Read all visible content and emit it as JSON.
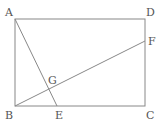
{
  "diagram": {
    "type": "geometry",
    "points": {
      "A": {
        "label": "A",
        "x": 15,
        "y": 19,
        "lx": 5,
        "ly": 16
      },
      "D": {
        "label": "D",
        "x": 145,
        "y": 19,
        "lx": 146,
        "ly": 16
      },
      "F": {
        "label": "F",
        "x": 145,
        "y": 41,
        "lx": 148,
        "ly": 45
      },
      "G": {
        "label": "G",
        "x": 49,
        "y": 88,
        "lx": 48,
        "ly": 84
      },
      "B": {
        "label": "B",
        "x": 15,
        "y": 106,
        "lx": 5,
        "ly": 119
      },
      "E": {
        "label": "E",
        "x": 57,
        "y": 106,
        "lx": 55,
        "ly": 119
      },
      "C": {
        "label": "C",
        "x": 145,
        "y": 106,
        "lx": 146,
        "ly": 119
      }
    },
    "segments": [
      "AD",
      "DC",
      "CB",
      "BA",
      "AE",
      "BF"
    ],
    "colors": {
      "line": "#888888",
      "label": "#555555"
    }
  }
}
